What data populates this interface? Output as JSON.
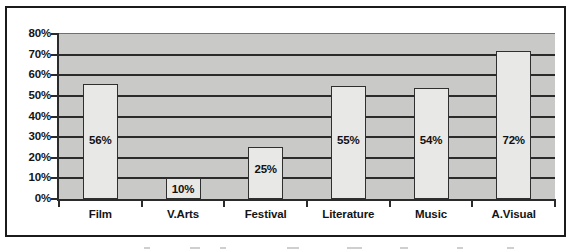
{
  "chart_data": {
    "type": "bar",
    "title": "",
    "subtitle": "",
    "xlabel": "",
    "ylabel": "",
    "categories": [
      "Film",
      "V.Arts",
      "Festival",
      "Literature",
      "Music",
      "A.Visual"
    ],
    "values": [
      56,
      25,
      25,
      55,
      54,
      72
    ],
    "series": [
      {
        "name": "",
        "values": [
          56,
          10,
          25,
          55,
          54,
          72
        ]
      }
    ],
    "data_labels": [
      "56%",
      "10%",
      "25%",
      "55%",
      "54%",
      "72%"
    ],
    "ylim": [
      0,
      80
    ],
    "y_tick_step": 10,
    "y_tick_labels": [
      "80%",
      "70%",
      "60%",
      "50%",
      "40%",
      "30%",
      "20%",
      "10%",
      "0%"
    ],
    "y_tick_values": [
      80,
      70,
      60,
      50,
      40,
      30,
      20,
      10,
      0
    ],
    "grid": "horizontal",
    "legend": "none",
    "legend_position": "none",
    "units": "percent",
    "colors": {
      "plot_background": "#c9c9c7",
      "bar_fill": "#e8e8e6",
      "bar_border": "#2f2f2f",
      "gridline": "#2b2b2b",
      "axis": "#2b2b2b",
      "text": "#141414",
      "frame_border": "#1b1b1b",
      "canvas": "#ffffff"
    }
  },
  "bars": [
    {
      "label": "Film",
      "value": 56,
      "display": "56%"
    },
    {
      "label": "V.Arts",
      "value": 10,
      "display": "10%"
    },
    {
      "label": "Festival",
      "value": 25,
      "display": "25%"
    },
    {
      "label": "Literature",
      "value": 55,
      "display": "55%"
    },
    {
      "label": "Music",
      "value": 54,
      "display": "54%"
    },
    {
      "label": "A.Visual",
      "value": 72,
      "display": "72%"
    }
  ]
}
